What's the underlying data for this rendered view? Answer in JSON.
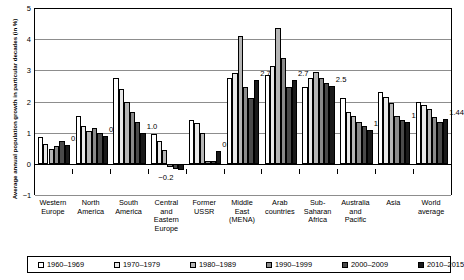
{
  "chart_data": {
    "type": "bar",
    "title": "",
    "subtitle": "",
    "xlabel": "",
    "ylabel": "Average annual population growth in particular decades (in %)",
    "ylim": [
      -1,
      5
    ],
    "yticks": [
      -1,
      0,
      1,
      2,
      3,
      4,
      5
    ],
    "ytick_labels": [
      "−1",
      "0",
      "1",
      "2",
      "3",
      "4",
      "5"
    ],
    "grid": true,
    "legend_position": "bottom",
    "categories": [
      "Western Europe",
      "North America",
      "South America",
      "Central and Eastern Europe",
      "Former USSR",
      "Middle East (MENA)",
      "Arab countries",
      "Sub-Saharan Africa",
      "Australia and Pacific",
      "Asia",
      "World average"
    ],
    "category_lines": [
      [
        "Western",
        "Europe"
      ],
      [
        "North",
        "America"
      ],
      [
        "South",
        "America"
      ],
      [
        "Central",
        "and",
        "Eastern",
        "Europe"
      ],
      [
        "Former",
        "USSR"
      ],
      [
        "Middle",
        "East",
        "(MENA)"
      ],
      [
        "Arab",
        "countries"
      ],
      [
        "Sub-",
        "Saharan",
        "Africa"
      ],
      [
        "Australia",
        "and",
        "Pacific"
      ],
      [
        "Asia"
      ],
      [
        "World",
        "average"
      ]
    ],
    "series": [
      {
        "name": "1960–1969",
        "color": "#ffffff",
        "values": [
          0.85,
          1.55,
          2.75,
          0.95,
          1.4,
          2.75,
          2.85,
          2.45,
          2.1,
          2.3,
          2.0
        ]
      },
      {
        "name": "1970–1979",
        "color": "#e8e8e8",
        "values": [
          0.65,
          1.22,
          2.4,
          0.72,
          1.3,
          2.9,
          3.15,
          2.75,
          1.65,
          2.15,
          1.9
        ]
      },
      {
        "name": "1980–1989",
        "color": "#b5b5b5",
        "values": [
          0.48,
          1.05,
          2.0,
          0.45,
          1.0,
          4.1,
          4.35,
          2.95,
          1.55,
          1.95,
          1.75
        ]
      },
      {
        "name": "1990–1999",
        "color": "#8a8a8a",
        "values": [
          0.58,
          1.15,
          1.65,
          -0.1,
          0.1,
          2.45,
          3.4,
          2.75,
          1.35,
          1.55,
          1.5
        ]
      },
      {
        "name": "2000–2009",
        "color": "#4a4a4a",
        "values": [
          0.72,
          0.98,
          1.35,
          -0.18,
          0.08,
          2.1,
          2.45,
          2.6,
          1.2,
          1.4,
          1.35
        ]
      },
      {
        "name": "2010–2015",
        "color": "#1a1a1a",
        "values": [
          0.62,
          0.9,
          1.0,
          -0.2,
          0.4,
          2.7,
          2.7,
          2.5,
          1.1,
          1.35,
          1.44
        ]
      }
    ],
    "annotations": [
      {
        "category": "Western Europe",
        "label": "0.6"
      },
      {
        "category": "North America",
        "label": "0.9"
      },
      {
        "category": "South America",
        "label": "1.0"
      },
      {
        "category": "Central and Eastern Europe",
        "label": "−0.2"
      },
      {
        "category": "Former USSR",
        "label": "0.4"
      },
      {
        "category": "Middle East (MENA)",
        "label": "2.7"
      },
      {
        "category": "Arab countries",
        "label": "2.7"
      },
      {
        "category": "Sub-Saharan Africa",
        "label": "2.5"
      },
      {
        "category": "Australia and Pacific",
        "label": "1.1"
      },
      {
        "category": "Asia",
        "label": "1.35"
      },
      {
        "category": "World average",
        "label": "1.44"
      }
    ]
  },
  "legend": {
    "items": [
      {
        "label": "1960–1969",
        "color": "#ffffff"
      },
      {
        "label": "1970–1979",
        "color": "#e8e8e8"
      },
      {
        "label": "1980–1989",
        "color": "#b5b5b5"
      },
      {
        "label": "1990–1999",
        "color": "#8a8a8a"
      },
      {
        "label": "2000–2009",
        "color": "#4a4a4a"
      },
      {
        "label": "2010–2015",
        "color": "#1a1a1a"
      }
    ]
  }
}
